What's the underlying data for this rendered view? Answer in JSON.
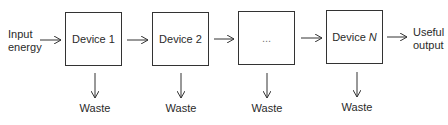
{
  "input": {
    "line1": "Input",
    "line2": "energy"
  },
  "output": {
    "line1": "Useful",
    "line2": "output"
  },
  "devices": [
    {
      "label": "Device 1"
    },
    {
      "label": "Device 2"
    },
    {
      "label": "..."
    },
    {
      "label_prefix": "Device ",
      "label_var": "N"
    }
  ],
  "waste_labels": [
    "Waste",
    "Waste",
    "Waste",
    "Waste"
  ],
  "colors": {
    "stroke": "#333333",
    "text": "#2a2a2a",
    "background": "#ffffff"
  }
}
